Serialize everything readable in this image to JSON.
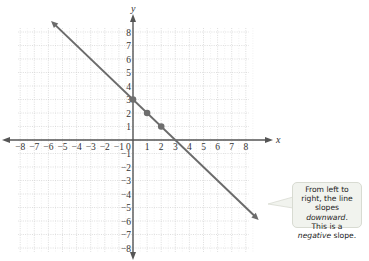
{
  "chart_data": {
    "type": "line",
    "title": "",
    "xlabel": "x",
    "ylabel": "y",
    "xlim": [
      -8,
      8
    ],
    "ylim": [
      -8,
      8
    ],
    "grid": true,
    "x_ticks": [
      -8,
      -7,
      -6,
      -5,
      -4,
      -3,
      -2,
      -1,
      0,
      1,
      2,
      3,
      4,
      5,
      6,
      7,
      8
    ],
    "y_ticks": [
      -8,
      -7,
      -6,
      -5,
      -4,
      -3,
      -2,
      -1,
      1,
      2,
      3,
      4,
      5,
      6,
      7,
      8
    ],
    "series": [
      {
        "name": "line",
        "equation": "y = -x + 3",
        "slope": -1,
        "y_intercept": 3,
        "x_intercept": 3,
        "points": [
          {
            "x": 0,
            "y": 3
          },
          {
            "x": 1,
            "y": 2
          },
          {
            "x": 2,
            "y": 1
          }
        ],
        "color": "#6b6b6b"
      }
    ],
    "annotations": [
      {
        "text": "From left to right, the line slopes downward. This is a negative slope."
      }
    ]
  },
  "axes": {
    "x_label": "x",
    "y_label": "y",
    "origin_label": "0"
  },
  "callout": {
    "line1": "From left to",
    "line2": "right, the line",
    "line3a": "slopes ",
    "line3b": "downward",
    "line3c": ".",
    "line4": "This is a",
    "line5a": "negative",
    "line5b": " slope."
  },
  "colors": {
    "line": "#6b6b6b",
    "axis": "#555555",
    "grid": "#c8c8c8",
    "callout_bg": "#f1f3ee"
  }
}
